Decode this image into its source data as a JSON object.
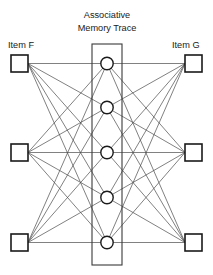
{
  "diagram": {
    "type": "neural-network-association-diagram",
    "title_lines": [
      "Associative",
      "Memory Trace"
    ],
    "left_label": "Item F",
    "right_label": "Item G",
    "colors": {
      "background": "#ffffff",
      "node_stroke": "#1a1a1a",
      "edge_stroke": "#4a4a4a",
      "box_stroke": "#3a3a3a",
      "text": "#1a1a1a"
    },
    "layout": {
      "width": 213,
      "height": 275,
      "square_size": 17,
      "circle_radius": 6.2,
      "trace_box": {
        "x": 92,
        "y": 44,
        "width": 30,
        "height": 221
      }
    },
    "left_nodes": [
      {
        "id": "f1",
        "cx": 19.5,
        "cy": 63.5
      },
      {
        "id": "f2",
        "cx": 19.5,
        "cy": 152.5
      },
      {
        "id": "f3",
        "cx": 19.5,
        "cy": 242.5
      }
    ],
    "right_nodes": [
      {
        "id": "g1",
        "cx": 193.5,
        "cy": 63.5
      },
      {
        "id": "g2",
        "cx": 193.5,
        "cy": 152.5
      },
      {
        "id": "g3",
        "cx": 193.5,
        "cy": 242.5
      }
    ],
    "trace_nodes": [
      {
        "id": "t1",
        "cx": 107,
        "cy": 63.5,
        "marked": false
      },
      {
        "id": "t2",
        "cx": 107,
        "cy": 107.5,
        "marked": true
      },
      {
        "id": "t3",
        "cx": 107,
        "cy": 152.5,
        "marked": true
      },
      {
        "id": "t4",
        "cx": 107,
        "cy": 197.5,
        "marked": true
      },
      {
        "id": "t5",
        "cx": 107,
        "cy": 242.5,
        "marked": false
      }
    ],
    "title_position": {
      "x": 107,
      "line1_y": 18,
      "line2_y": 31
    },
    "left_label_position": {
      "x": 8,
      "y": 48
    },
    "right_label_position": {
      "x": 172,
      "y": 48
    },
    "edges_note": "Every left square connects to every trace circle; every right square connects to every trace circle."
  }
}
